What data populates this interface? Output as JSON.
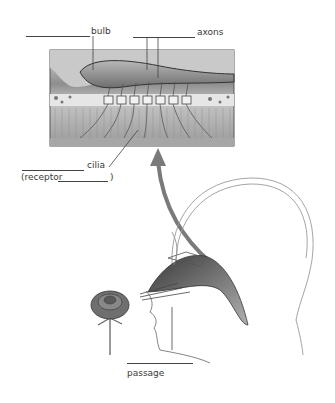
{
  "diagram": {
    "labels": {
      "bulb": "bulb",
      "axons": "axons",
      "cilia": "cilia",
      "receptor_open": "(receptor",
      "receptor_close": ")",
      "passage": "passage"
    },
    "colors": {
      "arrow": "#7a7a7a",
      "line": "#444444",
      "tissue": "#9a9a9a",
      "background": "#ffffff"
    },
    "icons": {
      "arrow": "curved-up-arrow",
      "rose": "rose-flower",
      "head": "head-cross-section"
    }
  }
}
